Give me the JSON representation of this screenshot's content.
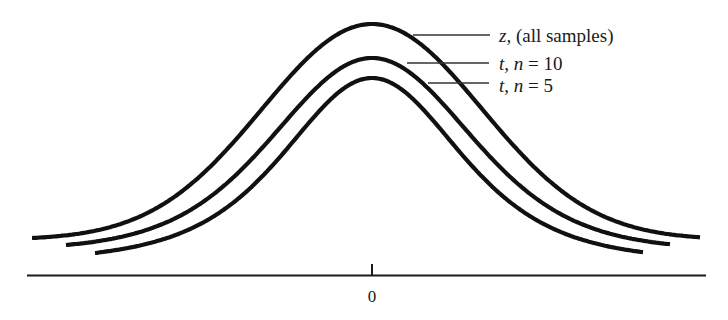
{
  "chart_data": {
    "type": "line",
    "title": "",
    "xlabel": "",
    "ylabel": "",
    "x_ticks": [
      {
        "value": 0,
        "label": "0"
      }
    ],
    "grid": false,
    "legend_position": "right of peak, with leader lines",
    "series": [
      {
        "name": "z, (all samples)",
        "italic_var": "z",
        "rest": ", (all samples)",
        "df": null,
        "peak_y_px": 24,
        "left_end": [
          32,
          238
        ],
        "right_end": [
          700,
          238
        ]
      },
      {
        "name": "t, n = 10",
        "italic_var": "t",
        "rest_n": "n",
        "rest": " = 10",
        "df": 9,
        "peak_y_px": 58,
        "left_end": [
          66,
          245
        ],
        "right_end": [
          670,
          246
        ]
      },
      {
        "name": "t, n = 5",
        "italic_var": "t",
        "rest_n": "n",
        "rest": " = 5",
        "df": 4,
        "peak_y_px": 78,
        "left_end": [
          95,
          253
        ],
        "right_end": [
          643,
          253
        ]
      }
    ]
  },
  "labels": {
    "z": {
      "var": "z",
      "text": ", (all samples)"
    },
    "t10": {
      "var": "t",
      "sep": ", ",
      "n": "n",
      "text": " = 10"
    },
    "t5": {
      "var": "t",
      "sep": ", ",
      "n": "n",
      "text": " = 5"
    },
    "zero": "0"
  }
}
